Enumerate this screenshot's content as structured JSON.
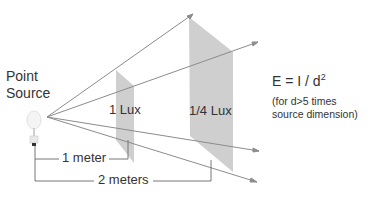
{
  "labels": {
    "source": "Point\nSource",
    "source_line1": "Point",
    "source_line2": "Source",
    "plane_near": "1 Lux",
    "plane_far": "1/4 Lux",
    "formula_main": "E = I / d",
    "formula_exp": "2",
    "note_line1": "(for d>5 times",
    "note_line2": "source dimension)",
    "dist_near": "1 meter",
    "dist_far": "2 meters"
  },
  "colors": {
    "ray": "#8a8a8a",
    "plane": "#c8c8c8",
    "bracket": "#777777",
    "text": "#333333"
  }
}
